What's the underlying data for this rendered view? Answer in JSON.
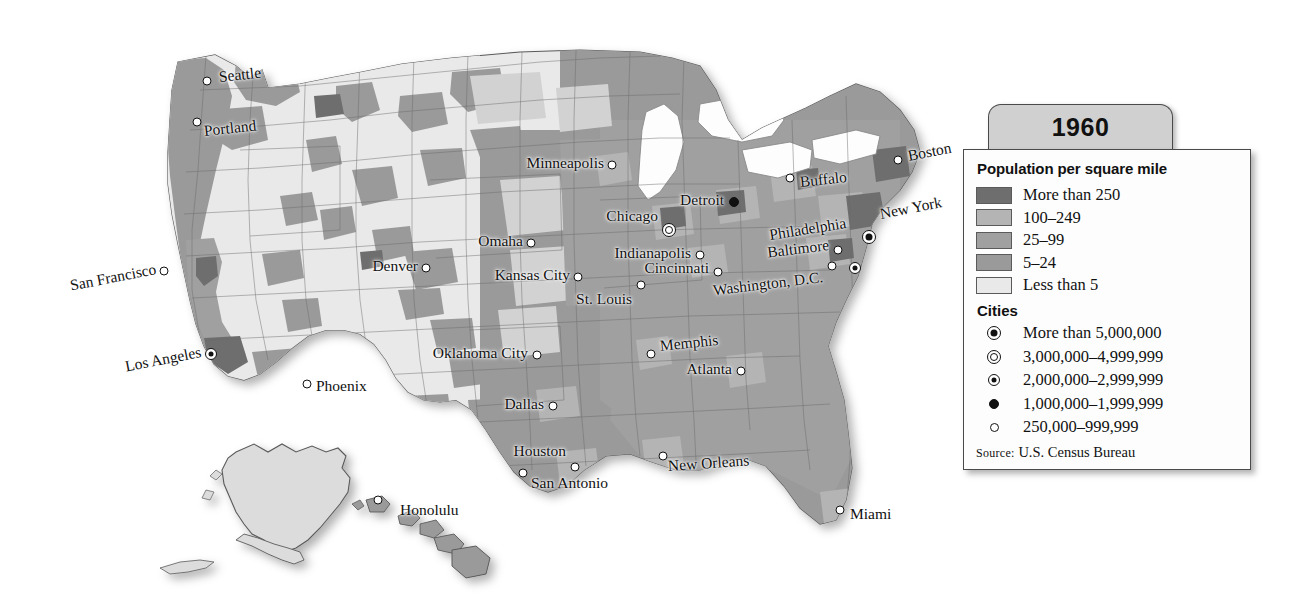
{
  "legend": {
    "year_tab": "1960",
    "density_title": "Population per square mile",
    "density_classes": [
      {
        "label": "More than 250",
        "color": "#6e6e6e"
      },
      {
        "label": "100–249",
        "color": "#b4b4b4"
      },
      {
        "label": "25–99",
        "color": "#a0a0a0"
      },
      {
        "label": "5–24",
        "color": "#9a9a9a"
      },
      {
        "label": "Less than 5",
        "color": "#e9e9e9"
      }
    ],
    "cities_title": "Cities",
    "city_classes": [
      {
        "label": "More than 5,000,000",
        "symbol": "circle-dot-filled-5m"
      },
      {
        "label": "3,000,000–4,999,999",
        "symbol": "double-circle-3m"
      },
      {
        "label": "2,000,000–2,999,999",
        "symbol": "circle-small-dot-2m"
      },
      {
        "label": "1,000,000–1,999,999",
        "symbol": "filled-circle-1m"
      },
      {
        "label": "250,000–999,999",
        "symbol": "open-circle-250k"
      }
    ],
    "source_prefix": "Source:",
    "source_text": " U.S. Census Bureau"
  },
  "map": {
    "cities": [
      {
        "name": "Seattle",
        "x": 207,
        "y": 81,
        "dot": "m-250k",
        "side": "right",
        "lx": 12,
        "ly": -4,
        "rot": -6
      },
      {
        "name": "Portland",
        "x": 197,
        "y": 122,
        "dot": "m-250k",
        "side": "right",
        "lx": 7,
        "ly": 9,
        "rot": -6
      },
      {
        "name": "San Francisco",
        "x": 164,
        "y": 271,
        "dot": "m-250k",
        "side": "left",
        "lx": -8,
        "ly": -2,
        "rot": -11
      },
      {
        "name": "Los Angeles",
        "x": 211,
        "y": 354,
        "dot": "m-2m",
        "side": "left",
        "lx": -10,
        "ly": -2,
        "rot": -11
      },
      {
        "name": "Phoenix",
        "x": 307,
        "y": 384,
        "dot": "m-250k",
        "side": "right",
        "lx": 9,
        "ly": 2,
        "rot": 0
      },
      {
        "name": "Denver",
        "x": 426,
        "y": 268,
        "dot": "m-250k",
        "side": "left",
        "lx": -8,
        "ly": -2,
        "rot": 0
      },
      {
        "name": "Minneapolis",
        "x": 612,
        "y": 165,
        "dot": "m-250k",
        "side": "left",
        "lx": -8,
        "ly": -2,
        "rot": 0
      },
      {
        "name": "Omaha",
        "x": 531,
        "y": 243,
        "dot": "m-250k",
        "side": "left",
        "lx": -8,
        "ly": -2,
        "rot": 0
      },
      {
        "name": "Kansas City",
        "x": 578,
        "y": 277,
        "dot": "m-250k",
        "side": "left",
        "lx": -8,
        "ly": -2,
        "rot": 0
      },
      {
        "name": "St. Louis",
        "x": 641,
        "y": 285,
        "dot": "m-250k",
        "side": "left",
        "lx": -9,
        "ly": 14,
        "rot": 0
      },
      {
        "name": "Chicago",
        "x": 669,
        "y": 218,
        "dot": "m-3m",
        "side": "left",
        "lx": -11,
        "ly": -2,
        "rot": 0
      },
      {
        "name": "Detroit",
        "x": 734,
        "y": 202,
        "dot": "m-1m",
        "side": "left",
        "lx": -10,
        "ly": -2,
        "rot": 0
      },
      {
        "name": "Indianapolis",
        "x": 700,
        "y": 255,
        "dot": "m-250k",
        "side": "left",
        "lx": -9,
        "ly": -2,
        "rot": 0
      },
      {
        "name": "Cincinnati",
        "x": 718,
        "y": 272,
        "dot": "m-250k",
        "side": "left",
        "lx": -9,
        "ly": -4,
        "rot": 0
      },
      {
        "name": "Buffalo",
        "x": 790,
        "y": 178,
        "dot": "m-250k",
        "side": "right",
        "lx": 10,
        "ly": 4,
        "rot": -6
      },
      {
        "name": "Boston",
        "x": 898,
        "y": 160,
        "dot": "m-250k",
        "side": "right",
        "lx": 10,
        "ly": -4,
        "rot": -11
      },
      {
        "name": "New York",
        "x": 869,
        "y": 211,
        "dot": "m-5m",
        "side": "right",
        "lx": 11,
        "ly": 3,
        "rot": -11
      },
      {
        "name": "Philadelphia",
        "x": 855,
        "y": 228,
        "dot": "m-2m",
        "side": "left",
        "lx": -9,
        "ly": -5,
        "rot": -9
      },
      {
        "name": "Baltimore",
        "x": 838,
        "y": 250,
        "dot": "m-250k",
        "side": "left",
        "lx": -9,
        "ly": -5,
        "rot": -7
      },
      {
        "name": "Washington, D.C.",
        "x": 832,
        "y": 266,
        "dot": "m-250k",
        "side": "left",
        "lx": -9,
        "ly": 11,
        "rot": -7
      },
      {
        "name": "Oklahoma City",
        "x": 537,
        "y": 355,
        "dot": "m-250k",
        "side": "left",
        "lx": -9,
        "ly": -2,
        "rot": 0
      },
      {
        "name": "Dallas",
        "x": 553,
        "y": 406,
        "dot": "m-250k",
        "side": "left",
        "lx": -9,
        "ly": -2,
        "rot": 0
      },
      {
        "name": "Houston",
        "x": 575,
        "y": 467,
        "dot": "m-250k",
        "side": "left",
        "lx": -9,
        "ly": -16,
        "rot": 0
      },
      {
        "name": "San Antonio",
        "x": 523,
        "y": 473,
        "dot": "m-250k",
        "side": "right",
        "lx": 8,
        "ly": 10,
        "rot": 0
      },
      {
        "name": "Memphis",
        "x": 651,
        "y": 354,
        "dot": "m-250k",
        "side": "right",
        "lx": 9,
        "ly": -8,
        "rot": -6
      },
      {
        "name": "Atlanta",
        "x": 741,
        "y": 371,
        "dot": "m-250k",
        "side": "left",
        "lx": -9,
        "ly": -2,
        "rot": 0
      },
      {
        "name": "New Orleans",
        "x": 663,
        "y": 456,
        "dot": "m-250k",
        "side": "right",
        "lx": 5,
        "ly": 10,
        "rot": -4
      },
      {
        "name": "Miami",
        "x": 840,
        "y": 510,
        "dot": "m-250k",
        "side": "right",
        "lx": 10,
        "ly": 4,
        "rot": 0
      },
      {
        "name": "Honolulu",
        "x": 378,
        "y": 500,
        "dot": "m-250k",
        "side": "right",
        "lx": 22,
        "ly": 10,
        "rot": 0
      }
    ]
  }
}
